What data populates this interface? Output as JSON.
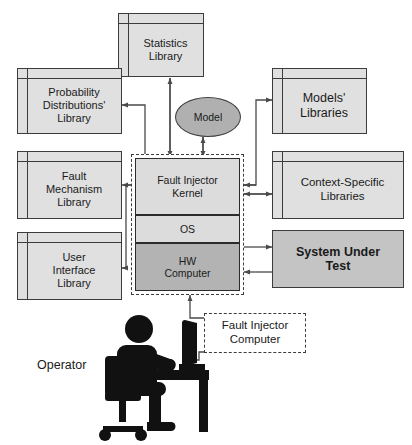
{
  "diagram": {
    "colors": {
      "component_fill": "#e0e0e0",
      "kernel_fill": "#dcdcdc",
      "os_fill": "#dcdcdc",
      "hw_fill": "#b3b3b3",
      "model_fill": "#b0b0b0",
      "sut_fill": "#c4c4c4",
      "stroke": "#3c3c3c",
      "text": "#1a1a1a",
      "background": "#ffffff"
    },
    "components": {
      "statistics_library": "Statistics\nLibrary",
      "probability_distributions_library": "Probability\nDistributions'\nLibrary",
      "fault_mechanism_library": "Fault\nMechanism\nLibrary",
      "user_interface_library": "User\nInterface\nLibrary",
      "models_libraries": "Models'\nLibraries",
      "context_specific_libraries": "Context-Specific\nLibraries",
      "system_under_test": "System Under\nTest"
    },
    "center_stack": {
      "kernel": "Fault Injector\nKernel",
      "os": "OS",
      "hw": "HW\nComputer"
    },
    "model": "Model",
    "fault_injector_computer": "Fault Injector\nComputer",
    "operator": "Operator"
  }
}
